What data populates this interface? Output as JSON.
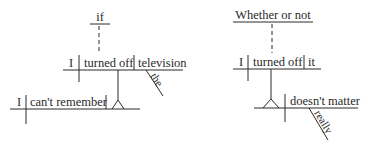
{
  "diagrams": [
    {
      "name": "left",
      "subordinator": "if",
      "clause": {
        "subject": "I",
        "verb": "turned off",
        "object": "television",
        "object_modifier": "the"
      },
      "main": {
        "subject": "I",
        "verb": "can't remember"
      }
    },
    {
      "name": "right",
      "subordinator": "Whether or not",
      "clause": {
        "subject": "I",
        "verb": "turned off",
        "object": "it"
      },
      "main": {
        "predicate": "doesn't matter",
        "modifier": "really"
      }
    }
  ]
}
